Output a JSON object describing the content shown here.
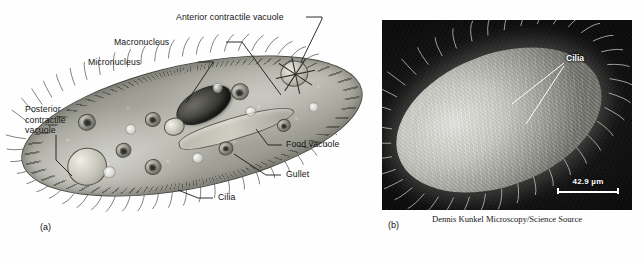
{
  "figure": {
    "panel_a": {
      "letter": "(a)",
      "labels": [
        {
          "id": "anterior-contractile-vacuole",
          "text": "Anterior contractile vacuole"
        },
        {
          "id": "macronucleus",
          "text": "Macronucleus"
        },
        {
          "id": "micronucleus",
          "text": "Micronucleus"
        },
        {
          "id": "posterior-contractile-vacuole",
          "text": "Posterior\ncontractile\nvacuole"
        },
        {
          "id": "food-vacuole",
          "text": "Food vacuole"
        },
        {
          "id": "gullet",
          "text": "Gullet"
        },
        {
          "id": "cilia",
          "text": "Cilia"
        }
      ],
      "label_texts": {
        "anterior_contractile_vacuole": "Anterior contractile vacuole",
        "macronucleus": "Macronucleus",
        "micronucleus": "Micronucleus",
        "posterior_contractile_vacuole_line1": "Posterior",
        "posterior_contractile_vacuole_line2": "contractile",
        "posterior_contractile_vacuole_line3": "vacuole",
        "food_vacuole": "Food vacuole",
        "gullet": "Gullet",
        "cilia": "Cilia"
      }
    },
    "panel_b": {
      "letter": "(b)",
      "callout": "Cilia",
      "scale_bar": "42.9 µm",
      "credit": "Dennis Kunkel Microscopy/Science Source"
    },
    "colors": {
      "page_background": "#ffffff",
      "cell_fill": "#a3a399",
      "cell_outline": "#4a4a44",
      "macronucleus": "#2b2b26",
      "micrograph_background": "#0d0d0d",
      "micrograph_organism": "#c9c9c3",
      "label_text": "#141414"
    }
  }
}
